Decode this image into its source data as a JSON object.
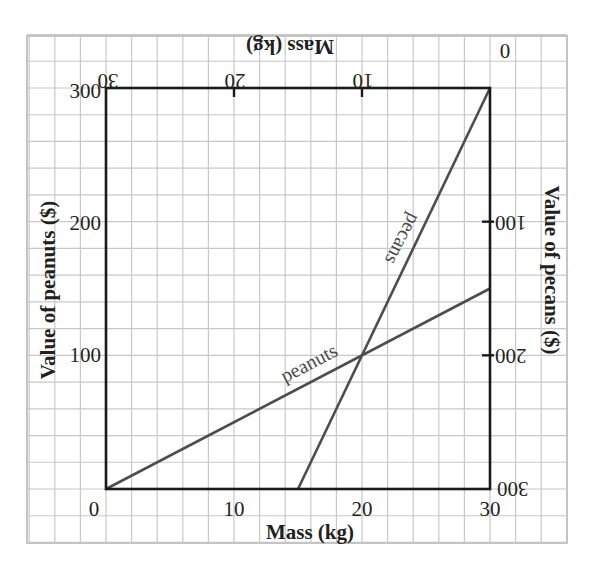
{
  "chart_data": {
    "type": "line",
    "title": "",
    "grid": true,
    "colors": {
      "grid": "#c8c8c8",
      "frame": "#1a1a1a",
      "series": "#4d4d4d",
      "text": "#231f20"
    },
    "bottom_axis": {
      "label": "Mass (kg)",
      "range": [
        0,
        30
      ],
      "ticks": [
        "0",
        "10",
        "20",
        "30"
      ]
    },
    "top_axis": {
      "label": "Mass (kg)",
      "orientation": "upside-down, reversed",
      "range": [
        30,
        0
      ],
      "ticks": [
        "30",
        "20",
        "10",
        "0"
      ]
    },
    "left_axis": {
      "label": "Value of peanuts ($)",
      "range": [
        0,
        300
      ],
      "ticks": [
        "0",
        "100",
        "200",
        "300"
      ]
    },
    "right_axis": {
      "label": "Value of pecans ($)",
      "orientation": "upside-down, reversed",
      "range": [
        300,
        0
      ],
      "ticks": [
        "0",
        "100",
        "200",
        "300"
      ]
    },
    "series": [
      {
        "name": "peanuts",
        "axes": "bottom/left",
        "x": [
          0,
          30
        ],
        "y": [
          0,
          150
        ],
        "unit_price": 5
      },
      {
        "name": "pecans",
        "axes": "top/right",
        "x": [
          0,
          15
        ],
        "y": [
          0,
          300
        ],
        "unit_price": 20
      }
    ],
    "intersection": {
      "label": "",
      "bottom_mass_kg": 20,
      "peanut_value": 100,
      "top_mass_kg": 10,
      "pecan_value": 200
    }
  }
}
